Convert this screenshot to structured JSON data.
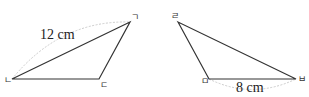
{
  "figure": {
    "triangle_left": {
      "vertices": {
        "top": "ㄱ",
        "left": "ㄴ",
        "right": "ㄷ"
      },
      "side_label": "12 cm"
    },
    "triangle_right": {
      "vertices": {
        "top": "ㄹ",
        "left": "ㅁ",
        "right": "ㅂ"
      },
      "side_label": "8 cm"
    },
    "colors": {
      "line": "#333333",
      "arc": "#cccccc"
    }
  }
}
